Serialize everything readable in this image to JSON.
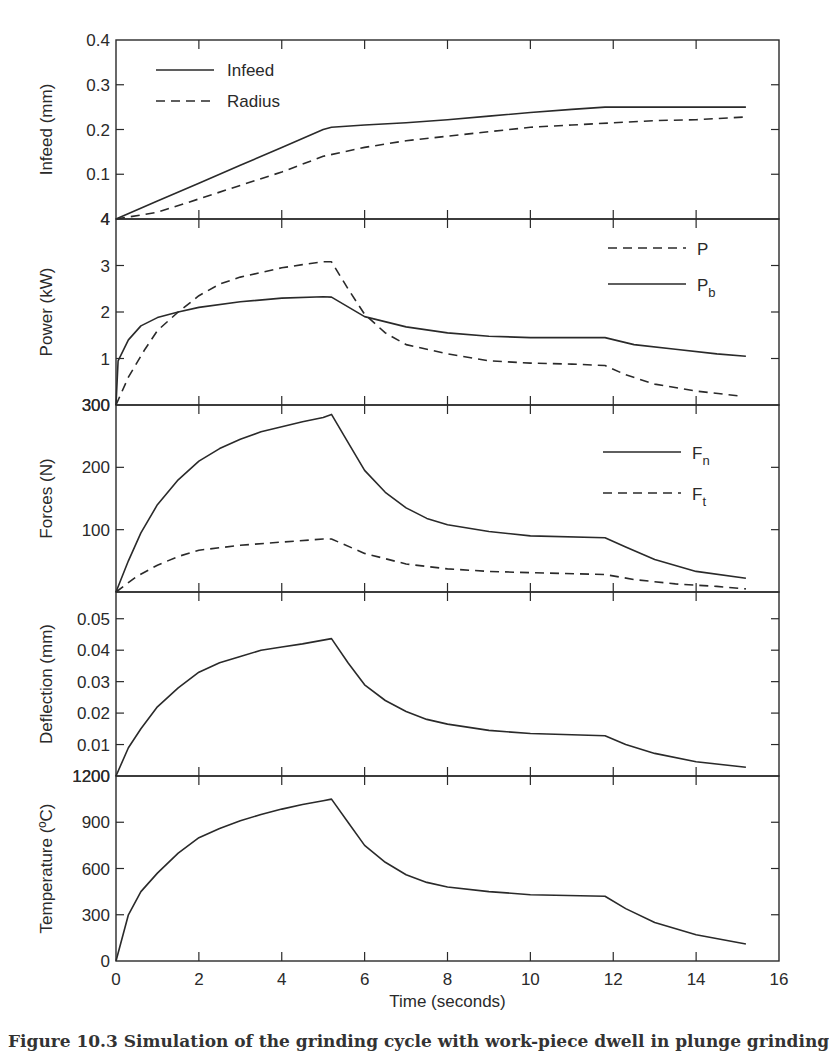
{
  "figure": {
    "xlabel": "Time (seconds)",
    "caption": "Figure 10.3 Simulation of the grinding cycle with work-piece dwell in plunge grinding",
    "line_color": "#2a2a2a"
  },
  "chart_data": [
    {
      "type": "line",
      "panel": 1,
      "ylabel": "Infeed (mm)",
      "xlim": [
        0,
        16
      ],
      "ylim": [
        0,
        0.4
      ],
      "yticks": [
        "0.4",
        "0.3",
        "0.2",
        "0.1",
        "4"
      ],
      "xticks": [
        0,
        2,
        4,
        6,
        8,
        10,
        12,
        14,
        16
      ],
      "legend_position": "upper left",
      "series": [
        {
          "name": "Infeed",
          "style": "solid",
          "x": [
            0,
            1,
            2,
            3,
            4,
            5,
            5.2,
            6,
            7,
            8,
            9,
            10,
            11,
            11.8,
            12,
            13,
            14,
            15.2
          ],
          "y": [
            0,
            0.04,
            0.08,
            0.12,
            0.16,
            0.2,
            0.205,
            0.21,
            0.215,
            0.222,
            0.23,
            0.238,
            0.245,
            0.25,
            0.25,
            0.25,
            0.25,
            0.25
          ]
        },
        {
          "name": "Radius",
          "style": "dashed",
          "x": [
            0,
            1,
            2,
            3,
            4,
            5,
            6,
            7,
            8,
            9,
            10,
            11,
            12,
            13,
            14,
            15.2
          ],
          "y": [
            0,
            0.015,
            0.045,
            0.075,
            0.105,
            0.14,
            0.16,
            0.175,
            0.185,
            0.195,
            0.205,
            0.21,
            0.215,
            0.22,
            0.222,
            0.228
          ]
        }
      ]
    },
    {
      "type": "line",
      "panel": 2,
      "ylabel": "Power (kW)",
      "xlim": [
        0,
        16
      ],
      "ylim": [
        0,
        4
      ],
      "yticks": [
        "4",
        "3",
        "2",
        "1",
        "300"
      ],
      "legend_position": "upper right",
      "series": [
        {
          "name": "P",
          "subscript": "",
          "style": "dashed",
          "x": [
            0,
            0.3,
            0.7,
            1,
            1.5,
            2,
            2.5,
            3,
            3.5,
            4,
            4.5,
            5,
            5.2,
            5.6,
            6,
            6.5,
            7,
            8,
            9,
            10,
            11,
            11.8,
            12.3,
            13,
            14,
            15
          ],
          "y": [
            0,
            0.6,
            1.2,
            1.6,
            2.0,
            2.35,
            2.6,
            2.75,
            2.85,
            2.95,
            3.02,
            3.08,
            3.08,
            2.5,
            1.95,
            1.55,
            1.3,
            1.1,
            0.95,
            0.9,
            0.88,
            0.85,
            0.65,
            0.45,
            0.3,
            0.2
          ]
        },
        {
          "name": "P",
          "subscript": "b",
          "style": "solid",
          "x": [
            0,
            0.05,
            0.3,
            0.6,
            1,
            1.5,
            2,
            3,
            4,
            5,
            5.2,
            6,
            7,
            8,
            9,
            10,
            11.8,
            12.5,
            13.5,
            14.5,
            15.2
          ],
          "y": [
            0,
            0.95,
            1.4,
            1.7,
            1.88,
            2.0,
            2.1,
            2.22,
            2.3,
            2.33,
            2.32,
            1.9,
            1.68,
            1.55,
            1.48,
            1.45,
            1.45,
            1.3,
            1.2,
            1.1,
            1.05
          ]
        }
      ]
    },
    {
      "type": "line",
      "panel": 3,
      "ylabel": "Forces (N)",
      "xlim": [
        0,
        16
      ],
      "ylim": [
        0,
        300
      ],
      "yticks": [
        "300",
        "200",
        "100"
      ],
      "legend_position": "upper right",
      "series": [
        {
          "name": "F",
          "subscript": "n",
          "style": "solid",
          "x": [
            0,
            0.3,
            0.6,
            1,
            1.5,
            2,
            2.5,
            3,
            3.5,
            4,
            4.5,
            5,
            5.2,
            5.6,
            6,
            6.5,
            7,
            7.5,
            8,
            9,
            10,
            11.8,
            12.3,
            13,
            14,
            15.2
          ],
          "y": [
            0,
            50,
            95,
            140,
            180,
            210,
            230,
            245,
            257,
            265,
            273,
            280,
            285,
            240,
            195,
            160,
            135,
            118,
            108,
            97,
            90,
            87,
            72,
            52,
            33,
            22
          ]
        },
        {
          "name": "F",
          "subscript": "t",
          "style": "dashed",
          "x": [
            0,
            0.5,
            1,
            1.5,
            2,
            3,
            4,
            5,
            5.2,
            6,
            7,
            8,
            9,
            10,
            11.8,
            12.5,
            13.5,
            14.5,
            15.2
          ],
          "y": [
            0,
            25,
            43,
            57,
            67,
            75,
            80,
            85,
            85,
            62,
            45,
            37,
            33,
            31,
            28,
            20,
            13,
            9,
            5
          ]
        }
      ]
    },
    {
      "type": "line",
      "panel": 4,
      "ylabel": "Deflection (mm)",
      "xlim": [
        0,
        16
      ],
      "ylim": [
        0,
        0.0585
      ],
      "yticks": [
        "0.05",
        "0.04",
        "0.03",
        "0.02",
        "0.01",
        "1200"
      ],
      "series": [
        {
          "name": "Deflection",
          "style": "solid",
          "x": [
            0,
            0.3,
            0.6,
            1,
            1.5,
            2,
            2.5,
            3,
            3.5,
            4,
            4.5,
            5,
            5.2,
            5.6,
            6,
            6.5,
            7,
            7.5,
            8,
            9,
            10,
            11.8,
            12.3,
            13,
            14,
            15.2
          ],
          "y": [
            0,
            0.009,
            0.015,
            0.022,
            0.028,
            0.033,
            0.036,
            0.038,
            0.04,
            0.041,
            0.042,
            0.0432,
            0.0437,
            0.036,
            0.029,
            0.024,
            0.0205,
            0.018,
            0.0165,
            0.0145,
            0.0135,
            0.0128,
            0.01,
            0.0072,
            0.0045,
            0.0028
          ]
        }
      ]
    },
    {
      "type": "line",
      "panel": 5,
      "ylabel": "Temperature (ºC)",
      "xlim": [
        0,
        16
      ],
      "ylim": [
        0,
        1200
      ],
      "yticks": [
        "1200",
        "900",
        "600",
        "300",
        "0"
      ],
      "series": [
        {
          "name": "Temperature",
          "style": "solid",
          "x": [
            0,
            0.3,
            0.6,
            1,
            1.5,
            2,
            2.5,
            3,
            3.5,
            4,
            4.5,
            5,
            5.2,
            5.6,
            6,
            6.5,
            7,
            7.5,
            8,
            9,
            10,
            11.8,
            12.3,
            13,
            14,
            15.2
          ],
          "y": [
            0,
            300,
            450,
            570,
            700,
            800,
            860,
            910,
            950,
            985,
            1015,
            1040,
            1050,
            900,
            750,
            640,
            560,
            510,
            480,
            450,
            430,
            420,
            340,
            250,
            170,
            110
          ]
        }
      ]
    }
  ]
}
